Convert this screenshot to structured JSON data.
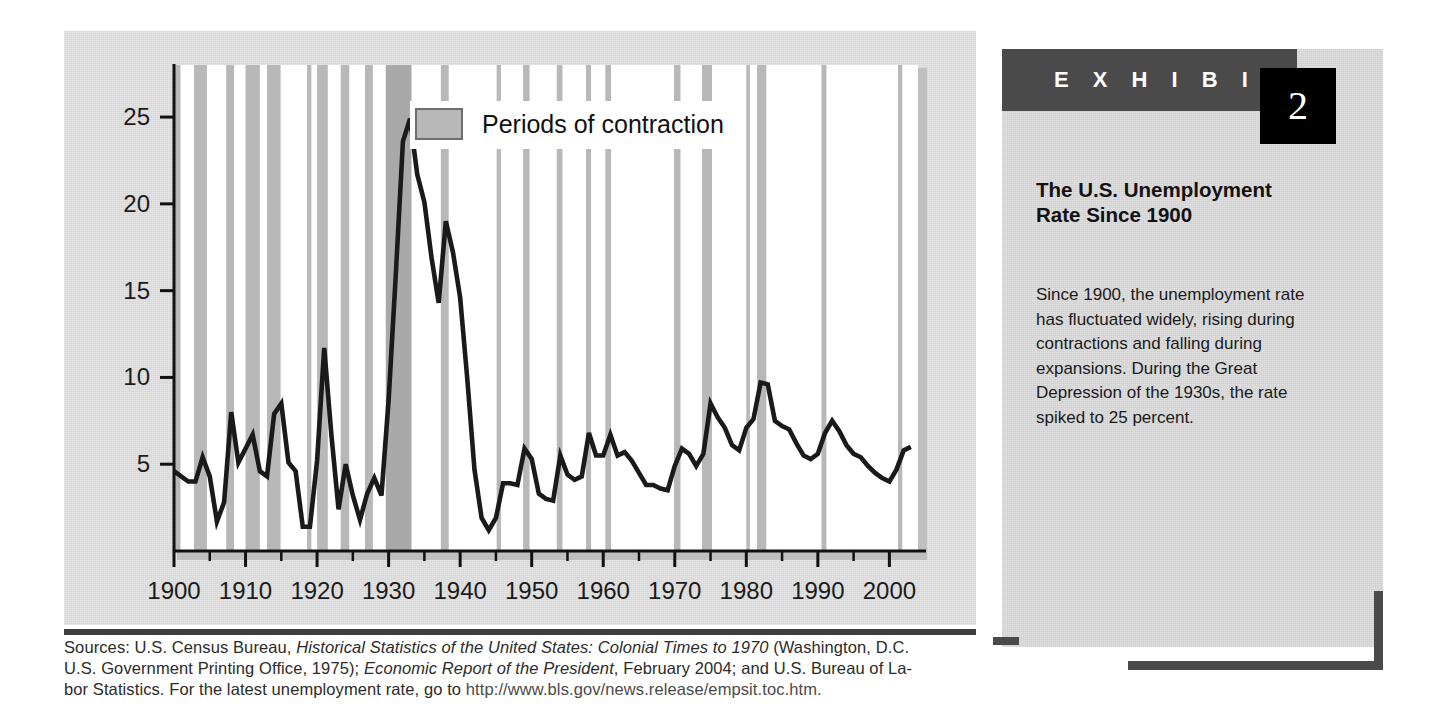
{
  "exhibit": {
    "label": "E X H I B I T",
    "number": "2",
    "title": "The U.S. Unemployment\nRate Since 1900",
    "body": "Since 1900, the unemployment rate has fluctuated widely, rising during contractions and falling during expansions. During the Great Depression of the 1930s, the rate spiked to 25 percent."
  },
  "sources": {
    "line1_a": "Sources: U.S. Census Bureau, ",
    "line1_b": "Historical Statistics of the United States: Colonial Times to 1970",
    "line1_c": " (Washington, D.C.",
    "line2_a": "U.S. Government Printing Office, 1975); ",
    "line2_b": "Economic Report of the President",
    "line2_c": ", February 2004; and U.S. Bureau of La-",
    "line3_a": "bor Statistics. For the latest unemployment rate, go to ",
    "line3_url": "http://www.bls.gov/news.release/empsit.toc.htm."
  },
  "colors": {
    "band": "#b8b8b8",
    "band_dark": "#a9a9a9",
    "line": "#1a1a1a",
    "axis": "#111111",
    "panel_bg": "#d0d0d0",
    "figure_bg": "#d6d6d6",
    "accent_dark": "#4a4a4a",
    "number_box": "#000000"
  },
  "chart_data": {
    "type": "line",
    "xlabel": "",
    "ylabel": "",
    "xlim": [
      1900,
      2004
    ],
    "ylim": [
      0,
      28
    ],
    "grid": false,
    "yticks": [
      5,
      10,
      15,
      20,
      25
    ],
    "ytick_labels": [
      "5",
      "10",
      "15",
      "20",
      "25"
    ],
    "xticks": [
      1900,
      1910,
      1920,
      1930,
      1940,
      1950,
      1960,
      1970,
      1980,
      1990,
      2000
    ],
    "xtick_labels": [
      "1900",
      "1910",
      "1920",
      "1930",
      "1940",
      "1950",
      "1960",
      "1970",
      "1980",
      "1990",
      "2000"
    ],
    "xminor_ticks": [
      1905,
      1915,
      1925,
      1935,
      1945,
      1955,
      1965,
      1975,
      1985,
      1995
    ],
    "legend": {
      "position": "top-center",
      "entries": [
        {
          "label": "Periods of contraction",
          "type": "shaded-band",
          "color": "#b8b8b8"
        }
      ]
    },
    "series": [
      {
        "name": "Unemployment rate (percent)",
        "color": "#1a1a1a",
        "x": [
          1900,
          1901,
          1902,
          1903,
          1904,
          1905,
          1906,
          1907,
          1908,
          1909,
          1910,
          1911,
          1912,
          1913,
          1914,
          1915,
          1916,
          1917,
          1918,
          1919,
          1920,
          1921,
          1922,
          1923,
          1924,
          1925,
          1926,
          1927,
          1928,
          1929,
          1930,
          1931,
          1932,
          1933,
          1934,
          1935,
          1936,
          1937,
          1938,
          1939,
          1940,
          1941,
          1942,
          1943,
          1944,
          1945,
          1946,
          1947,
          1948,
          1949,
          1950,
          1951,
          1952,
          1953,
          1954,
          1955,
          1956,
          1957,
          1958,
          1959,
          1960,
          1961,
          1962,
          1963,
          1964,
          1965,
          1966,
          1967,
          1968,
          1969,
          1970,
          1971,
          1972,
          1973,
          1974,
          1975,
          1976,
          1977,
          1978,
          1979,
          1980,
          1981,
          1982,
          1983,
          1984,
          1985,
          1986,
          1987,
          1988,
          1989,
          1990,
          1991,
          1992,
          1993,
          1994,
          1995,
          1996,
          1997,
          1998,
          1999,
          2000,
          2001,
          2002,
          2003
        ],
        "y": [
          4.6,
          4.3,
          4.0,
          4.0,
          5.4,
          4.3,
          1.7,
          2.8,
          8.0,
          5.1,
          5.9,
          6.7,
          4.6,
          4.3,
          7.9,
          8.5,
          5.1,
          4.6,
          1.4,
          1.4,
          5.2,
          11.7,
          6.7,
          2.4,
          5.0,
          3.2,
          1.8,
          3.3,
          4.2,
          3.2,
          8.7,
          15.9,
          23.6,
          24.9,
          21.7,
          20.1,
          16.9,
          14.3,
          19.0,
          17.2,
          14.6,
          9.9,
          4.7,
          1.9,
          1.2,
          1.9,
          3.9,
          3.9,
          3.8,
          5.9,
          5.3,
          3.3,
          3.0,
          2.9,
          5.5,
          4.4,
          4.1,
          4.3,
          6.8,
          5.5,
          5.5,
          6.7,
          5.5,
          5.7,
          5.2,
          4.5,
          3.8,
          3.8,
          3.6,
          3.5,
          4.9,
          5.9,
          5.6,
          4.9,
          5.6,
          8.5,
          7.7,
          7.1,
          6.1,
          5.8,
          7.1,
          7.6,
          9.7,
          9.6,
          7.5,
          7.2,
          7.0,
          6.2,
          5.5,
          5.3,
          5.6,
          6.8,
          7.5,
          6.9,
          6.1,
          5.6,
          5.4,
          4.9,
          4.5,
          4.2,
          4.0,
          4.7,
          5.8,
          6.0
        ]
      }
    ],
    "contraction_bands": [
      {
        "start": 1900.0,
        "end": 1900.9
      },
      {
        "start": 1902.8,
        "end": 1904.6
      },
      {
        "start": 1907.3,
        "end": 1908.4
      },
      {
        "start": 1910.0,
        "end": 1912.0
      },
      {
        "start": 1913.0,
        "end": 1914.9
      },
      {
        "start": 1918.6,
        "end": 1919.2
      },
      {
        "start": 1920.0,
        "end": 1921.5
      },
      {
        "start": 1923.3,
        "end": 1924.5
      },
      {
        "start": 1926.7,
        "end": 1927.8
      },
      {
        "start": 1929.6,
        "end": 1933.2
      },
      {
        "start": 1937.3,
        "end": 1938.4
      },
      {
        "start": 1945.1,
        "end": 1945.7
      },
      {
        "start": 1948.8,
        "end": 1949.7
      },
      {
        "start": 1953.5,
        "end": 1954.3
      },
      {
        "start": 1957.6,
        "end": 1958.3
      },
      {
        "start": 1960.3,
        "end": 1961.1
      },
      {
        "start": 1969.9,
        "end": 1970.8
      },
      {
        "start": 1973.8,
        "end": 1975.2
      },
      {
        "start": 1980.0,
        "end": 1980.5
      },
      {
        "start": 1981.5,
        "end": 1982.8
      },
      {
        "start": 1990.5,
        "end": 1991.2
      },
      {
        "start": 2001.2,
        "end": 2001.8
      }
    ]
  }
}
